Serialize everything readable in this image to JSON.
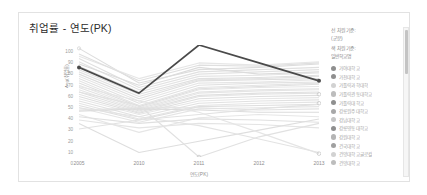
{
  "card": {
    "title": "취업률 - 연도(PK)"
  },
  "axes": {
    "y_title": "Avg(취업률)",
    "y_ticks": [
      "100",
      "90",
      "80",
      "70",
      "60",
      "50",
      "40",
      "30",
      "20",
      "10",
      "0"
    ],
    "x_title": "연도(PK)",
    "x_ticks": [
      "2005",
      "2010",
      "2011",
      "2012",
      "2013"
    ]
  },
  "legend": {
    "header_line1": "선 차원 기준:",
    "header_line2": "(군분)",
    "header_line3": "색 차원 기준:",
    "header_line4": "일반학교명",
    "items": [
      {
        "label": "가야대학교",
        "color": "#8f8f8f"
      },
      {
        "label": "가천대학교",
        "color": "#8f8f8f"
      },
      {
        "label": "가톨릭과학대학",
        "color": "#d2d2d2"
      },
      {
        "label": "가톨릭관동대학교",
        "color": "#bdbdbd"
      },
      {
        "label": "가톨릭대학교",
        "color": "#8f8f8f"
      },
      {
        "label": "강릉원주대학교",
        "color": "#a8a8a8"
      },
      {
        "label": "강남대학교",
        "color": "#c6c6c6"
      },
      {
        "label": "강릉영동대학교",
        "color": "#8f8f8f"
      },
      {
        "label": "강원대학교",
        "color": "#b5b5b5"
      },
      {
        "label": "건국대학교",
        "color": "#a0a0a0"
      },
      {
        "label": "건양대학교글로컬",
        "color": "#d2d2d2"
      },
      {
        "label": "건양대학교",
        "color": "#bdbdbd"
      }
    ]
  },
  "chart_data": {
    "type": "line",
    "title": "취업률 - 연도(PK)",
    "xlabel": "연도(PK)",
    "ylabel": "Avg(취업률)",
    "x": [
      "2005",
      "2010",
      "2011",
      "2012",
      "2013"
    ],
    "ylim": [
      0,
      100
    ],
    "xlim_categories": 5,
    "grid": false,
    "legend_position": "right",
    "highlighted_series": {
      "name": "선택 학교",
      "color": "#4a4a4a",
      "values": [
        80,
        57,
        100,
        84,
        68
      ],
      "markers": true
    },
    "background_series_note": "다수의 회색 배경 선 (선택되지 않은 학교들)",
    "background_series": [
      {
        "color": "#dddddd",
        "values": [
          97,
          66,
          78,
          80,
          83
        ]
      },
      {
        "color": "#e0e0e0",
        "values": [
          88,
          62,
          76,
          78,
          80
        ]
      },
      {
        "color": "#e2e2e2",
        "values": [
          85,
          60,
          74,
          76,
          78
        ]
      },
      {
        "color": "#dcdcdc",
        "values": [
          83,
          64,
          80,
          74,
          76
        ]
      },
      {
        "color": "#e4e4e4",
        "values": [
          81,
          58,
          72,
          73,
          75
        ]
      },
      {
        "color": "#e0e0e0",
        "values": [
          78,
          56,
          70,
          71,
          73
        ]
      },
      {
        "color": "#e3e3e3",
        "values": [
          76,
          54,
          69,
          70,
          72
        ]
      },
      {
        "color": "#dedede",
        "values": [
          74,
          52,
          68,
          69,
          70
        ]
      },
      {
        "color": "#e5e5e5",
        "values": [
          72,
          50,
          66,
          67,
          69
        ]
      },
      {
        "color": "#e1e1e1",
        "values": [
          70,
          48,
          64,
          66,
          67
        ]
      },
      {
        "color": "#e4e4e4",
        "values": [
          68,
          46,
          62,
          64,
          66
        ]
      },
      {
        "color": "#dfdfdf",
        "values": [
          66,
          45,
          61,
          63,
          65
        ]
      },
      {
        "color": "#e6e6e6",
        "values": [
          64,
          44,
          60,
          62,
          63
        ]
      },
      {
        "color": "#e2e2e2",
        "values": [
          62,
          43,
          58,
          60,
          61
        ]
      },
      {
        "color": "#e5e5e5",
        "values": [
          60,
          42,
          57,
          59,
          60
        ]
      },
      {
        "color": "#e0e0e0",
        "values": [
          58,
          41,
          55,
          57,
          58
        ]
      },
      {
        "color": "#e3e3e3",
        "values": [
          56,
          40,
          54,
          56,
          57
        ]
      },
      {
        "color": "#dedede",
        "values": [
          54,
          39,
          52,
          54,
          55
        ]
      },
      {
        "color": "#e6e6e6",
        "values": [
          52,
          38,
          50,
          52,
          53
        ]
      },
      {
        "color": "#e1e1e1",
        "values": [
          50,
          36,
          48,
          50,
          51
        ]
      },
      {
        "color": "#e4e4e4",
        "values": [
          48,
          34,
          46,
          48,
          49
        ]
      },
      {
        "color": "#dfdfdf",
        "values": [
          46,
          33,
          45,
          46,
          47
        ]
      },
      {
        "color": "#e5e5e5",
        "values": [
          44,
          31,
          43,
          44,
          45
        ]
      },
      {
        "color": "#e2e2e2",
        "values": [
          42,
          44,
          44,
          42,
          43
        ]
      },
      {
        "color": "#dcdcdc",
        "values": [
          41,
          43,
          42,
          40,
          40
        ]
      },
      {
        "color": "#e6e6e6",
        "values": [
          38,
          22,
          35,
          38,
          36
        ]
      },
      {
        "color": "#e0e0e0",
        "values": [
          36,
          30,
          34,
          33,
          31
        ]
      },
      {
        "color": "#e4e4e4",
        "values": [
          33,
          26,
          30,
          29,
          26
        ]
      },
      {
        "color": "#e2e2e2",
        "values": [
          25,
          33,
          38,
          43,
          47
        ]
      },
      {
        "color": "#dedede",
        "values": [
          30,
          4,
          14,
          24,
          34
        ]
      },
      {
        "color": "#e5e5e5",
        "values": [
          63,
          50,
          40,
          22,
          3
        ]
      },
      {
        "color": "#e3e3e3",
        "values": [
          44,
          36,
          28,
          16,
          4
        ]
      },
      {
        "color": "#e1e1e1",
        "values": [
          58,
          46,
          0,
          18,
          30
        ]
      },
      {
        "color": "#e6e6e6",
        "values": [
          90,
          70,
          84,
          82,
          85
        ]
      },
      {
        "color": "#dfdfdf",
        "values": [
          92,
          68,
          82,
          81,
          84
        ]
      }
    ]
  }
}
